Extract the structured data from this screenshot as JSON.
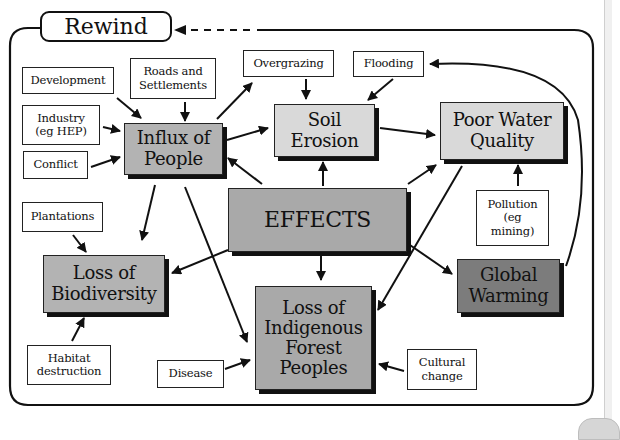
{
  "header": {
    "rewind_label": "Rewind"
  },
  "diagram": {
    "center": {
      "id": "effects",
      "label": "EFFECTS"
    },
    "effects": [
      {
        "id": "influx",
        "label": "Influx of\nPeople"
      },
      {
        "id": "soil",
        "label": "Soil\nErosion"
      },
      {
        "id": "water",
        "label": "Poor Water\nQuality"
      },
      {
        "id": "biodiversity",
        "label": "Loss of\nBiodiversity"
      },
      {
        "id": "warming",
        "label": "Global\nWarming"
      },
      {
        "id": "indigenous",
        "label": "Loss of\nIndigenous\nForest\nPeoples"
      }
    ],
    "causes": [
      {
        "id": "development",
        "label": "Development"
      },
      {
        "id": "roads",
        "label": "Roads and\nSettlements"
      },
      {
        "id": "industry",
        "label": "Industry\n(eg HEP)"
      },
      {
        "id": "conflict",
        "label": "Conflict"
      },
      {
        "id": "overgrazing",
        "label": "Overgrazing"
      },
      {
        "id": "flooding",
        "label": "Flooding"
      },
      {
        "id": "pollution",
        "label": "Pollution\n(eg\nmining)"
      },
      {
        "id": "plantations",
        "label": "Plantations"
      },
      {
        "id": "habitat",
        "label": "Habitat\ndestruction"
      },
      {
        "id": "disease",
        "label": "Disease"
      },
      {
        "id": "cultural",
        "label": "Cultural\nchange"
      }
    ],
    "edges": [
      [
        "development",
        "influx"
      ],
      [
        "roads",
        "influx"
      ],
      [
        "industry",
        "influx"
      ],
      [
        "conflict",
        "influx"
      ],
      [
        "influx",
        "overgrazing"
      ],
      [
        "influx",
        "soil"
      ],
      [
        "effects",
        "influx"
      ],
      [
        "overgrazing",
        "soil"
      ],
      [
        "flooding",
        "soil"
      ],
      [
        "effects",
        "soil"
      ],
      [
        "soil",
        "water"
      ],
      [
        "effects",
        "water"
      ],
      [
        "pollution",
        "water"
      ],
      [
        "water",
        "indigenous"
      ],
      [
        "warming",
        "flooding"
      ],
      [
        "effects",
        "warming"
      ],
      [
        "effects",
        "biodiversity"
      ],
      [
        "effects",
        "indigenous"
      ],
      [
        "influx",
        "biodiversity"
      ],
      [
        "influx",
        "indigenous"
      ],
      [
        "plantations",
        "biodiversity"
      ],
      [
        "habitat",
        "biodiversity"
      ],
      [
        "disease",
        "indigenous"
      ],
      [
        "cultural",
        "indigenous"
      ]
    ]
  }
}
